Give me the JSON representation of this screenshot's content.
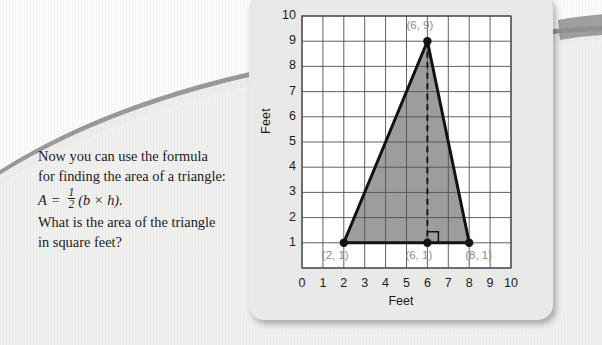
{
  "lesson": {
    "paragraph_1": "Now you can use the formula for finding the area of a triangle:",
    "formula": {
      "lhs": "A",
      "equals": "=",
      "numerator": "1",
      "denominator": "2",
      "rhs": "(b × h)."
    },
    "paragraph_2": "What is the area of the triangle in square feet?"
  },
  "chart_data": {
    "type": "scatter",
    "title": "",
    "xlabel": "Feet",
    "ylabel": "Feet",
    "xlim": [
      0,
      10
    ],
    "ylim": [
      0,
      10
    ],
    "xticks": [
      "0",
      "1",
      "2",
      "3",
      "4",
      "5",
      "6",
      "7",
      "8",
      "9",
      "10"
    ],
    "yticks": [
      "1",
      "2",
      "3",
      "4",
      "5",
      "6",
      "7",
      "8",
      "9",
      "10"
    ],
    "grid": true,
    "legend": "none",
    "shape": "triangle",
    "vertices": [
      {
        "x": 2,
        "y": 1,
        "label": "(2, 1)"
      },
      {
        "x": 8,
        "y": 1,
        "label": "(8, 1)"
      },
      {
        "x": 6,
        "y": 9,
        "label": "(6, 9)"
      }
    ],
    "height_segment": {
      "from": {
        "x": 6,
        "y": 9
      },
      "to": {
        "x": 6,
        "y": 1
      },
      "style": "dashed",
      "label": "(6, 1)"
    },
    "base_length": 6,
    "height_length": 8,
    "fill_color": "#9d9d9d",
    "outline_color": "#121212",
    "label_color": "#8c8c8c"
  },
  "colors": {
    "background": "#f2f2f1",
    "card": "#e9e9e8",
    "arc": "#9a9a9a",
    "text": "#1c1c1c",
    "grid_line": "#4f4f4f",
    "plot_background": "#ffffff"
  }
}
